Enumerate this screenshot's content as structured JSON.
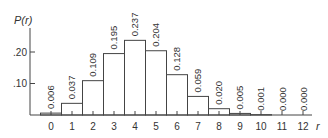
{
  "chart_data": {
    "type": "bar",
    "title": "",
    "xlabel": "r",
    "ylabel": "P(r)",
    "categories": [
      "0",
      "1",
      "2",
      "3",
      "4",
      "5",
      "6",
      "7",
      "8",
      "9",
      "10",
      "11",
      "12"
    ],
    "values": [
      0.006,
      0.037,
      0.109,
      0.195,
      0.237,
      0.204,
      0.128,
      0.059,
      0.02,
      0.005,
      0.001,
      0.0,
      0.0
    ],
    "value_labels": [
      "0.006",
      "0.037",
      "0.109",
      "0.195",
      "0.237",
      "0.204",
      "0.128",
      "0.059",
      "0.020",
      "0.005",
      "0.001",
      "0.000",
      "0.000"
    ],
    "yticks": [
      ".10",
      ".20"
    ],
    "ytick_values": [
      0.1,
      0.2
    ],
    "ylim": [
      0,
      0.27
    ],
    "grid": false,
    "legend": null
  },
  "colors": {
    "axis": "#444444",
    "bar_fill": "#ffffff",
    "bar_stroke": "#444444",
    "text": "#333333"
  }
}
